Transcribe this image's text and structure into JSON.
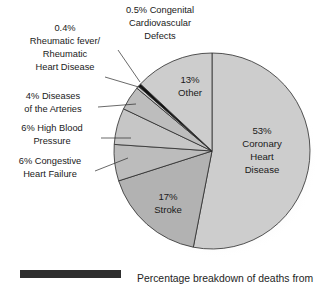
{
  "chart_data": {
    "type": "pie",
    "title": "",
    "caption": "Percentage breakdown of deaths from",
    "legend_position": "none",
    "grid": false,
    "total": 100,
    "start_angle_deg": 0,
    "direction": "clockwise",
    "categories": [
      "Coronary Heart Disease",
      "Stroke",
      "Congestive Heart Failure",
      "High Blood Pressure",
      "Diseases of the Arteries",
      "Rheumatic fever/Rheumatic Heart Disease",
      "Congenital Cardiovascular Defects",
      "Other"
    ],
    "values": [
      53,
      17,
      6,
      6,
      4,
      0.4,
      0.5,
      13
    ],
    "slices": [
      {
        "name": "coronary-heart-disease",
        "percent_label": "53%",
        "label_lines": [
          "53%",
          "Coronary",
          "Heart",
          "Disease"
        ],
        "value": 53,
        "color": "#cdcdcd",
        "label_placement": "inside"
      },
      {
        "name": "stroke",
        "percent_label": "17%",
        "label_lines": [
          "17%",
          "Stroke"
        ],
        "value": 17,
        "color": "#b2b2b2",
        "label_placement": "inside"
      },
      {
        "name": "congestive-heart-failure",
        "percent_label": "6%",
        "label_lines": [
          "6% Congestive",
          "Heart Failure"
        ],
        "value": 6,
        "color": "#bcbcbc",
        "label_placement": "outside"
      },
      {
        "name": "high-blood-pressure",
        "percent_label": "6%",
        "label_lines": [
          "6% High Blood",
          "Pressure"
        ],
        "value": 6,
        "color": "#c6c6c6",
        "label_placement": "outside"
      },
      {
        "name": "diseases-of-the-arteries",
        "percent_label": "4%",
        "label_lines": [
          "4% Diseases",
          "of the Arteries"
        ],
        "value": 4,
        "color": "#bdbdbd",
        "label_placement": "outside"
      },
      {
        "name": "rheumatic-heart-disease",
        "percent_label": "0.4%",
        "label_lines": [
          "0.4%",
          "Rheumatic fever/",
          "Rheumatic",
          "Heart Disease"
        ],
        "value": 0.4,
        "color": "#c9c9c9",
        "label_placement": "outside"
      },
      {
        "name": "congenital-cardiovascular-defects",
        "percent_label": "0.5%",
        "label_lines": [
          "0.5% Congenital",
          "Cardiovascular",
          "Defects"
        ],
        "value": 0.5,
        "color": "#111111",
        "label_placement": "outside"
      },
      {
        "name": "other",
        "percent_label": "13%",
        "label_lines": [
          "13%",
          "Other"
        ],
        "value": 13,
        "color": "#cdcdcd",
        "label_placement": "inside"
      }
    ]
  },
  "labels": {
    "coronary": {
      "line1": "53%",
      "line2": "Coronary",
      "line3": "Heart",
      "line4": "Disease"
    },
    "stroke": {
      "line1": "17%",
      "line2": "Stroke"
    },
    "other": {
      "line1": "13%",
      "line2": "Other"
    },
    "congestive": {
      "line1": "6% Congestive",
      "line2": "Heart Failure"
    },
    "highblood": {
      "line1": "6% High Blood",
      "line2": "Pressure"
    },
    "arteries": {
      "line1": "4% Diseases",
      "line2": "of the Arteries"
    },
    "rheumatic": {
      "line1": "0.4%",
      "line2": "Rheumatic fever/",
      "line3": "Rheumatic",
      "line4": "Heart Disease"
    },
    "congenital": {
      "line1": "0.5% Congenital",
      "line2": "Cardiovascular",
      "line3": "Defects"
    }
  },
  "caption": {
    "text": "Percentage breakdown of deaths from"
  },
  "colors": {
    "slice_light": "#cdcdcd",
    "slice_medium": "#b2b2b2",
    "slice_dark": "#111111",
    "outline": "#2b2b2b",
    "text": "#1a1a1a",
    "rule": "#2e2e2e",
    "background": "#ffffff"
  }
}
